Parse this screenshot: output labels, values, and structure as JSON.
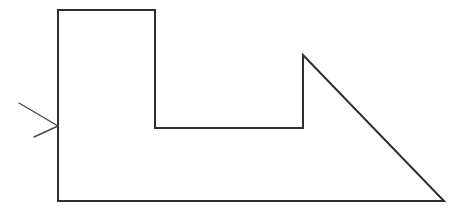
{
  "figure": {
    "type": "geometry-line-drawing",
    "background_color": "#ffffff",
    "stroke_color": "#2e2e2e",
    "stroke_width": 2,
    "canvas": {
      "width": 466,
      "height": 214
    },
    "shape": {
      "name": "notched-polygon-with-right-triangle",
      "closed": true,
      "vertices": [
        {
          "label": "top-left",
          "x": 58,
          "y": 10
        },
        {
          "label": "top-right-of-left-column",
          "x": 155,
          "y": 10
        },
        {
          "label": "notch-inner-left",
          "x": 155,
          "y": 128
        },
        {
          "label": "notch-inner-right",
          "x": 303,
          "y": 128
        },
        {
          "label": "triangle-apex",
          "x": 303,
          "y": 55
        },
        {
          "label": "bottom-right",
          "x": 444,
          "y": 201
        },
        {
          "label": "bottom-left",
          "x": 58,
          "y": 201
        }
      ],
      "path": "M 58 10 L 155 10 L 155 128 L 303 128 L 303 55 L 444 201 L 58 201 Z"
    },
    "annotation": {
      "name": "leader-arrow",
      "arrow_color": "#4a4a4a",
      "arrow_stroke_width": 1.4,
      "tail": {
        "x": 19,
        "y": 103
      },
      "tip": {
        "x": 58,
        "y": 126
      },
      "barb_upper": {
        "x": 38,
        "y": 101
      },
      "barb_lower": {
        "x": 34,
        "y": 137
      },
      "points_to": "left-vertical-edge",
      "shaft_path": "M 19 103 L 58 126",
      "barb_path": "M 58 126 L 34 137"
    }
  }
}
